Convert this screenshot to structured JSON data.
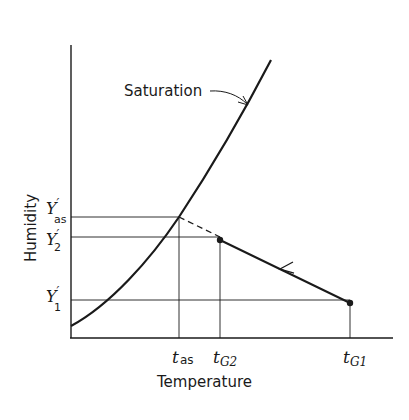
{
  "diagram": {
    "type": "psychrometric-adiabatic-saturation",
    "axes": {
      "x_label": "Temperature",
      "y_label": "Humidity"
    },
    "curve_label": "Saturation",
    "y_ticks": [
      {
        "id": "Y_as",
        "main": "Y",
        "prime": "′",
        "sub": "as"
      },
      {
        "id": "Y_2",
        "main": "Y",
        "prime": "′",
        "sub": "2"
      },
      {
        "id": "Y_1",
        "main": "Y",
        "prime": "′",
        "sub": "1"
      }
    ],
    "x_ticks": [
      {
        "id": "t_as",
        "main": "t",
        "sub": "as"
      },
      {
        "id": "t_G2",
        "main": "t",
        "sub": "G2"
      },
      {
        "id": "t_G1",
        "main": "t",
        "sub": "G1"
      }
    ],
    "points": [
      {
        "name": "state-2",
        "x_tick": "t_G2",
        "y_tick": "Y_2"
      },
      {
        "name": "state-1",
        "x_tick": "t_G1",
        "y_tick": "Y_1"
      }
    ],
    "process_line": {
      "from": "state-1",
      "to": "state-2",
      "direction_arrow": true
    },
    "extrapolation": {
      "from": "state-2",
      "to": "saturation at t_as",
      "style": "dashed"
    },
    "colors": {
      "ink": "#1a1a1a",
      "background": "#ffffff"
    }
  }
}
